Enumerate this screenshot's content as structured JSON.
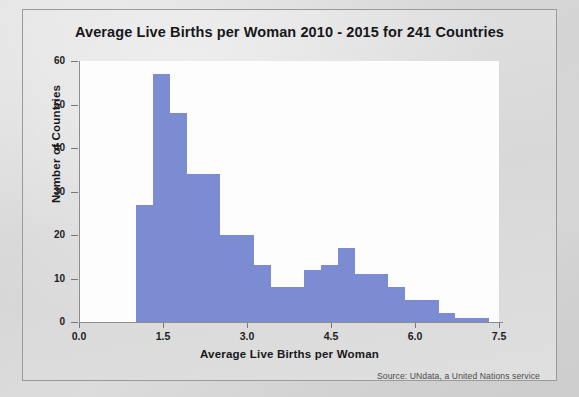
{
  "figure": {
    "title": "Average Live Births per Woman 2010 - 2015 for 241 Countries",
    "source_note": "Source: UNdata, a United Nations service",
    "bar_color": "#7b8cd2",
    "plot_bg": "#fdfdfd",
    "panel_bg": "#dcdcdc"
  },
  "chart_data": {
    "type": "bar",
    "title": "Average Live Births per Woman 2010 - 2015 for 241 Countries",
    "xlabel": "Average Live Births per Woman",
    "ylabel": "Number of Countries",
    "xlim": [
      0.0,
      7.5
    ],
    "ylim": [
      0,
      60
    ],
    "xticks": [
      "0.0",
      "1.5",
      "3.0",
      "4.5",
      "6.0",
      "7.5"
    ],
    "xtick_values": [
      0.0,
      1.5,
      3.0,
      4.5,
      6.0,
      7.5
    ],
    "yticks": [
      "0",
      "10",
      "20",
      "30",
      "40",
      "50",
      "60"
    ],
    "ytick_values": [
      0,
      10,
      20,
      30,
      40,
      50,
      60
    ],
    "grid": false,
    "legend": null,
    "bin_width": 0.3,
    "bins": [
      {
        "x0": 1.02,
        "x1": 1.32,
        "value": 27
      },
      {
        "x0": 1.32,
        "x1": 1.62,
        "value": 57
      },
      {
        "x0": 1.62,
        "x1": 1.92,
        "value": 48
      },
      {
        "x0": 1.92,
        "x1": 2.22,
        "value": 34
      },
      {
        "x0": 2.22,
        "x1": 2.52,
        "value": 34
      },
      {
        "x0": 2.52,
        "x1": 2.82,
        "value": 20
      },
      {
        "x0": 2.82,
        "x1": 3.12,
        "value": 20
      },
      {
        "x0": 3.12,
        "x1": 3.42,
        "value": 13
      },
      {
        "x0": 3.42,
        "x1": 3.72,
        "value": 8
      },
      {
        "x0": 3.72,
        "x1": 4.02,
        "value": 8
      },
      {
        "x0": 4.02,
        "x1": 4.32,
        "value": 12
      },
      {
        "x0": 4.32,
        "x1": 4.62,
        "value": 13
      },
      {
        "x0": 4.62,
        "x1": 4.92,
        "value": 17
      },
      {
        "x0": 4.92,
        "x1": 5.22,
        "value": 11
      },
      {
        "x0": 5.22,
        "x1": 5.52,
        "value": 11
      },
      {
        "x0": 5.52,
        "x1": 5.82,
        "value": 8
      },
      {
        "x0": 5.82,
        "x1": 6.12,
        "value": 5
      },
      {
        "x0": 6.12,
        "x1": 6.42,
        "value": 5
      },
      {
        "x0": 6.42,
        "x1": 6.72,
        "value": 2
      },
      {
        "x0": 6.72,
        "x1": 7.02,
        "value": 1
      },
      {
        "x0": 7.02,
        "x1": 7.32,
        "value": 1
      }
    ]
  }
}
